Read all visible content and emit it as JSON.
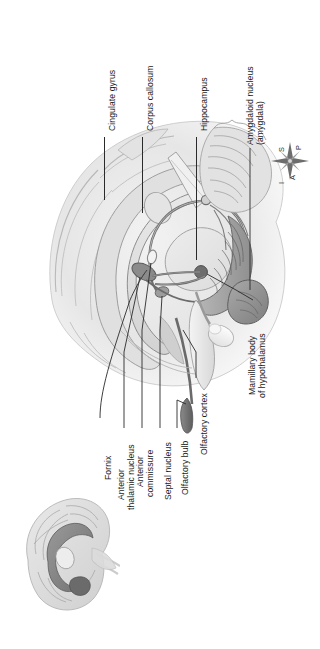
{
  "figure": {
    "type": "anatomical-illustration",
    "orientation": "page content rotated 90 degrees counter-clockwise",
    "background_color": "#ffffff",
    "ink_color": "#1b1b1b",
    "leader_color": "#2a2a2a"
  },
  "labels": {
    "cingulate_gyrus": "Cingulate gyrus",
    "corpus_callosum": "Corpus callosum",
    "hippocampus": "Hippocampus",
    "amygdaloid_nucleus_l1": "Amygdaloid nucleus",
    "amygdaloid_nucleus_l2": "(amygdala)",
    "fornix": "Fornix",
    "anterior_thalamic_l1": "Anterior",
    "anterior_thalamic_l2": "thalamic nucleus",
    "anterior_commissure_l1": "Anterior",
    "anterior_commissure_l2": "commissure",
    "septal_nucleus": "Septal nucleus",
    "olfactory_bulb": "Olfactory bulb",
    "olfactory_cortex": "Olfactory cortex",
    "mamillary_body_l1": "Mamillary body",
    "mamillary_body_l2": "of hypothalamus"
  },
  "compass": {
    "name": "anatomical-orientation-rose",
    "posterior": "P",
    "superior": "S",
    "inferior": "I",
    "anterior": "A"
  },
  "inset": {
    "name": "whole-brain-orientation-inset",
    "description": "small sagittal whole-brain showing limbic ring location"
  }
}
